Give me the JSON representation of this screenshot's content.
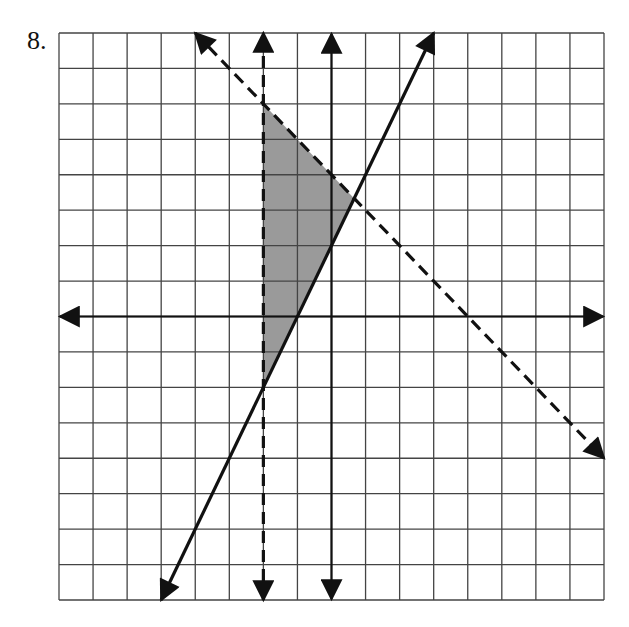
{
  "problem": {
    "number_label": "8."
  },
  "colors": {
    "grid": "#444444",
    "axis": "#111111",
    "line": "#111111",
    "shade": "#9a9a9a",
    "background": "#ffffff"
  },
  "chart_data": {
    "type": "line",
    "title": "",
    "xlabel": "",
    "ylabel": "",
    "xlim": [
      -8,
      8
    ],
    "ylim": [
      -8,
      8
    ],
    "grid": true,
    "grid_step": 1,
    "tick_labels": false,
    "series": [
      {
        "name": "y = 2x + 2",
        "style": "solid",
        "arrows": "both",
        "points": [
          [
            -5,
            -8
          ],
          [
            3,
            8
          ]
        ]
      },
      {
        "name": "x = -2",
        "style": "dashed",
        "arrows": "both",
        "points": [
          [
            -2,
            -8
          ],
          [
            -2,
            8
          ]
        ]
      },
      {
        "name": "y = -x + 4",
        "style": "dashed",
        "arrows": "both",
        "points": [
          [
            -4,
            8
          ],
          [
            8,
            -4
          ]
        ]
      }
    ],
    "shaded_region": {
      "description": "x > -2, y >= 2x + 2, y < -x + 4",
      "vertices": [
        [
          -2,
          6
        ],
        [
          0.667,
          3.333
        ],
        [
          -2,
          -2
        ]
      ]
    }
  }
}
